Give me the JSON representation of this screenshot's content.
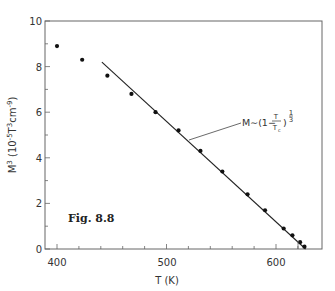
{
  "chart_data": {
    "type": "scatter",
    "title": "",
    "figure_label": "Fig. 8.8",
    "xlabel": "T (K)",
    "ylabel": "M³ (10⁻⁵ T³cm⁻⁹)",
    "xlim": [
      390,
      641
    ],
    "ylim": [
      0,
      10
    ],
    "x_ticks": [
      400,
      500,
      600
    ],
    "x_minor_step": 20,
    "y_ticks": [
      0,
      2,
      4,
      6,
      8,
      10
    ],
    "y_minor_step": 1,
    "grid": false,
    "series": [
      {
        "name": "measured M³",
        "style": "points",
        "x": [
          400,
          423,
          446,
          468,
          490,
          511,
          531,
          551,
          574,
          590,
          607,
          615,
          622,
          626
        ],
        "y": [
          8.9,
          8.3,
          7.6,
          6.8,
          6.0,
          5.2,
          4.3,
          3.4,
          2.4,
          1.7,
          0.9,
          0.6,
          0.3,
          0.1
        ]
      },
      {
        "name": "M ~ (1 - T/Tc)^(1/3) fit",
        "style": "line",
        "x": [
          441,
          627
        ],
        "y": [
          8.2,
          0.0
        ]
      }
    ],
    "annotations": [
      {
        "text": "M∼(1−T/Tc)^(1/3)",
        "points_to": "fit line"
      }
    ]
  },
  "labels": {
    "x_axis_title": "T (K)",
    "y_axis_title_main": "M",
    "y_axis_title_sup": "3",
    "y_axis_title_units": "(10",
    "y_axis_title_units_sup1": "-5",
    "y_axis_title_units_mid": "T",
    "y_axis_title_units_sup2": "3",
    "y_axis_title_units_cm": "cm",
    "y_axis_title_units_sup3": "-9",
    "y_axis_title_units_close": ")",
    "fig_label": "Fig. 8.8",
    "anno_prefix": "M∼(1−",
    "anno_T": "T",
    "anno_Tc": "T",
    "anno_c": "c",
    "anno_close": ")",
    "anno_exp_num": "1",
    "anno_exp_den": "3",
    "x_tick_400": "400",
    "x_tick_500": "500",
    "x_tick_600": "600",
    "y_tick_0": "0",
    "y_tick_2": "2",
    "y_tick_4": "4",
    "y_tick_6": "6",
    "y_tick_8": "8",
    "y_tick_10": "10"
  },
  "colors": {
    "axis": "#555555",
    "points": "#111111",
    "line": "#222222"
  }
}
